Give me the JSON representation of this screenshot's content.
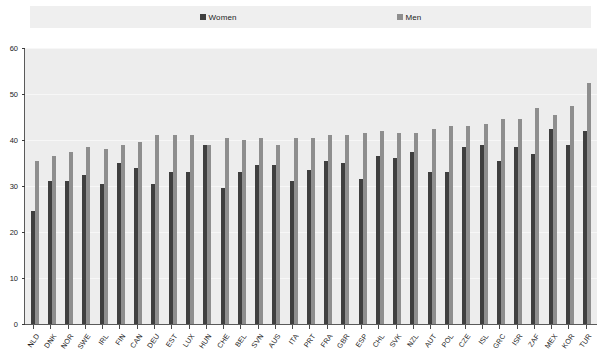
{
  "legend": {
    "items": [
      {
        "label": "Women",
        "color": "#3f3f3f"
      },
      {
        "label": "Men",
        "color": "#8e8e8e"
      }
    ]
  },
  "axes": {
    "y_ticks": [
      "0",
      "10",
      "20",
      "30",
      "40",
      "50",
      "60"
    ]
  },
  "chart_data": {
    "type": "bar",
    "title": "",
    "subtitle": "",
    "xlabel": "",
    "ylabel": "",
    "ylim": [
      0,
      60
    ],
    "ytick_step": 10,
    "grid": true,
    "legend_position": "top",
    "orientation": "vertical",
    "grouping": "grouped",
    "categories": [
      "NLD",
      "DNK",
      "NOR",
      "SWE",
      "IRL",
      "FIN",
      "CAN",
      "DEU",
      "EST",
      "LUX",
      "HUN",
      "CHE",
      "BEL",
      "SVN",
      "AUS",
      "ITA",
      "PRT",
      "FRA",
      "GBR",
      "ESP",
      "CHL",
      "SVK",
      "NZL",
      "AUT",
      "POL",
      "CZE",
      "ISL",
      "GRC",
      "ISR",
      "ZAF",
      "MEX",
      "KOR",
      "TUR"
    ],
    "series": [
      {
        "name": "Women",
        "color": "#3f3f3f",
        "values": [
          24.5,
          31.0,
          31.0,
          32.5,
          30.5,
          35.0,
          34.0,
          30.5,
          33.0,
          33.0,
          39.0,
          29.5,
          33.0,
          34.5,
          34.5,
          31.0,
          33.5,
          35.5,
          35.0,
          31.5,
          36.5,
          36.0,
          37.5,
          33.0,
          33.0,
          38.5,
          39.0,
          35.5,
          38.5,
          37.0,
          42.5,
          39.0,
          42.0
        ]
      },
      {
        "name": "Men",
        "color": "#8e8e8e",
        "values": [
          35.5,
          36.5,
          37.5,
          38.5,
          38.0,
          39.0,
          39.5,
          41.0,
          41.0,
          41.0,
          39.0,
          40.5,
          40.0,
          40.5,
          39.0,
          40.5,
          40.5,
          41.0,
          41.0,
          41.5,
          42.0,
          41.5,
          41.5,
          42.5,
          43.0,
          43.0,
          43.5,
          44.5,
          44.5,
          47.0,
          45.5,
          47.5,
          52.5
        ]
      }
    ]
  }
}
